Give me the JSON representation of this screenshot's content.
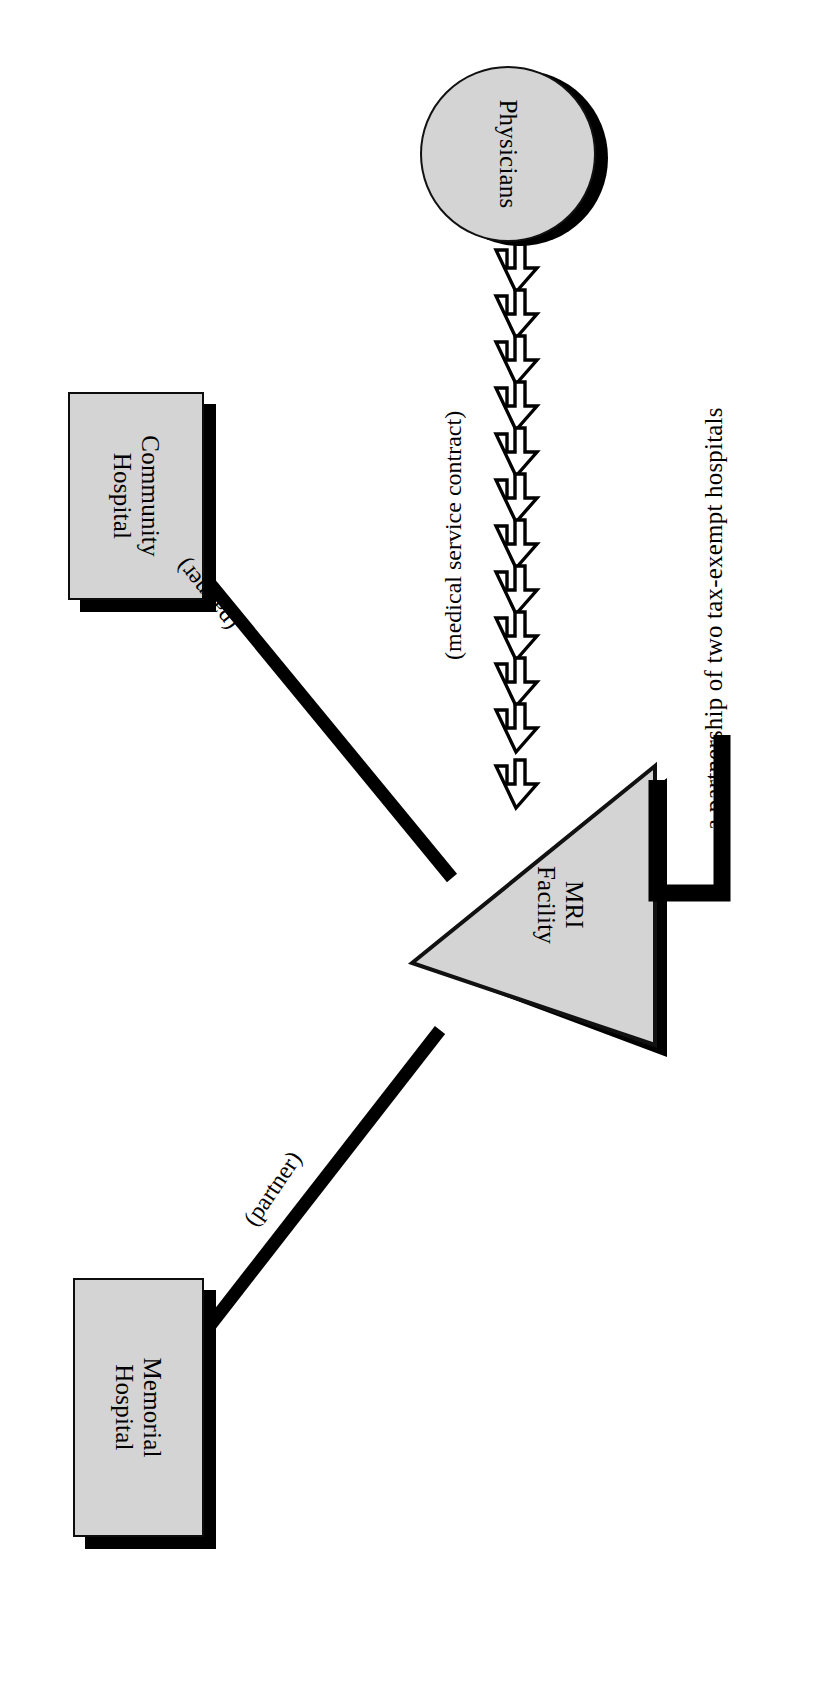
{
  "diagram": {
    "title_caption": "a partnership of two tax-exempt hospitals",
    "orientation_note": "rotated-90",
    "colors": {
      "node_fill": "#d4d4d4",
      "node_stroke": "#0d0d0d",
      "shadow": "#000000",
      "background": "#ffffff"
    },
    "nodes": [
      {
        "id": "physicians",
        "label": "Physicians",
        "shape": "circle",
        "fill": "#d4d4d4"
      },
      {
        "id": "community",
        "label": "Community\nHospital",
        "shape": "rectangle",
        "fill": "#d4d4d4"
      },
      {
        "id": "memorial",
        "label": "Memorial\nHospital",
        "shape": "rectangle",
        "fill": "#d4d4d4"
      },
      {
        "id": "mri",
        "label": "MRI\nFacility",
        "shape": "triangle",
        "fill": "#d4d4d4"
      }
    ],
    "edges": [
      {
        "id": "community-mri",
        "from": "community",
        "to": "mri",
        "label": "(partner)",
        "style": "thick-line"
      },
      {
        "id": "memorial-mri",
        "from": "memorial",
        "to": "mri",
        "label": "(partner)",
        "style": "thick-line"
      },
      {
        "id": "physicians-mri",
        "from": "physicians",
        "to": "mri",
        "label": "(medical service contract)",
        "style": "double-arrow-chain",
        "arrow_count": 12
      }
    ],
    "bracket": {
      "id": "mri-caption-bracket",
      "target": "mri",
      "label": "a partnership of two tax-exempt hospitals"
    }
  }
}
